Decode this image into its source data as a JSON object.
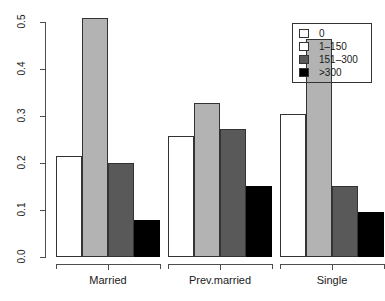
{
  "chart_data": {
    "type": "bar",
    "title": "",
    "xlabel": "",
    "ylabel": "",
    "categories": [
      "Married",
      "Prev.married",
      "Single"
    ],
    "series": [
      {
        "name": "0",
        "color": "#ffffff",
        "values": [
          0.215,
          0.257,
          0.305
        ]
      },
      {
        "name": "1–150",
        "color": "#b3b3b3",
        "values": [
          0.508,
          0.327,
          0.463
        ]
      },
      {
        "name": "151–300",
        "color": "#595959",
        "values": [
          0.199,
          0.272,
          0.151
        ]
      },
      {
        "name": ">300",
        "color": "#000000",
        "values": [
          0.079,
          0.151,
          0.096
        ]
      }
    ],
    "ylim": [
      0.0,
      0.5
    ],
    "yticks": [
      "0.0",
      "0.1",
      "0.2",
      "0.3",
      "0.4",
      "0.5"
    ],
    "ytick_values": [
      0.0,
      0.1,
      0.2,
      0.3,
      0.4,
      0.5
    ],
    "grid": false,
    "legend_position": "top-right",
    "legend_entries": [
      "0",
      "1–150",
      "151–300",
      ">300"
    ]
  }
}
